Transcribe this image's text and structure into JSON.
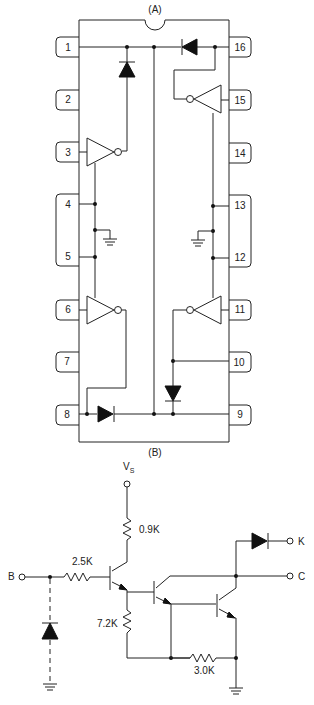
{
  "figure": {
    "panel_a_label": "(A)",
    "panel_b_label": "(B)"
  },
  "panel_a": {
    "chip_type": "16-pin DIP",
    "left_pins": [
      {
        "number": "1"
      },
      {
        "number": "2"
      },
      {
        "number": "3"
      },
      {
        "number": "4"
      },
      {
        "number": "5"
      },
      {
        "number": "6"
      },
      {
        "number": "7"
      },
      {
        "number": "8"
      }
    ],
    "right_pins": [
      {
        "number": "16"
      },
      {
        "number": "15"
      },
      {
        "number": "14"
      },
      {
        "number": "13"
      },
      {
        "number": "12"
      },
      {
        "number": "11"
      },
      {
        "number": "10"
      },
      {
        "number": "9"
      }
    ]
  },
  "panel_b": {
    "supply_label": "V",
    "supply_subscript": "S",
    "terminals": {
      "base": "B",
      "collector": "C",
      "cathode": "K"
    },
    "resistors": {
      "r_collector": "0.9K",
      "r_base": "2.5K",
      "r_emitter": "7.2K",
      "r_bottom": "3.0K"
    }
  }
}
